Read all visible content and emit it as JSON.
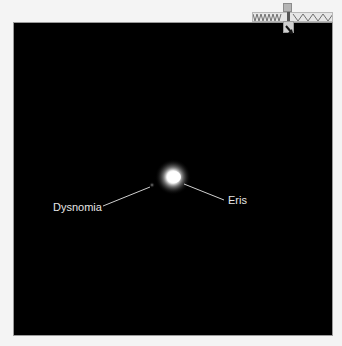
{
  "image": {
    "background_color": "#000000",
    "frame_border_color": "#9a9a9a",
    "page_background": "#f4f4f4"
  },
  "objects": [
    {
      "name": "Eris",
      "label": "Eris",
      "center": [
        173,
        177
      ],
      "type": "primary-body"
    },
    {
      "name": "Dysnomia",
      "label": "Dysnomia",
      "center": [
        152,
        185
      ],
      "type": "moon"
    }
  ],
  "labels": {
    "eris": "Eris",
    "dysnomia": "Dysnomia"
  },
  "compass_widget": {
    "tag_text": "",
    "pointer_icon": "arrow-down-right-icon"
  }
}
